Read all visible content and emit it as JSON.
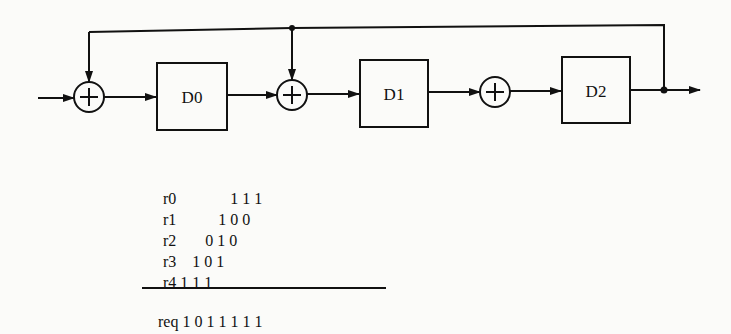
{
  "diagram": {
    "type": "lfsr-block-diagram",
    "blocks": [
      {
        "id": "D0",
        "label": "D0"
      },
      {
        "id": "D1",
        "label": "D1"
      },
      {
        "id": "D2",
        "label": "D2"
      }
    ],
    "adders": [
      {
        "id": "adder0",
        "symbol": "+"
      },
      {
        "id": "adder1",
        "symbol": "+"
      },
      {
        "id": "adder2",
        "symbol": "+"
      }
    ],
    "connections": [
      "input -> adder0",
      "adder0 -> D0",
      "D0 -> adder1",
      "adder1 -> D1",
      "D1 -> adder2",
      "adder2 -> D2",
      "D2 -> output",
      "output -> feedback -> adder0",
      "feedback -> adder1"
    ]
  },
  "table": {
    "rows": [
      {
        "label": "r0",
        "bits": "1 1 1",
        "offset": 4
      },
      {
        "label": "r1",
        "bits": "1 0 0",
        "offset": 3
      },
      {
        "label": "r2",
        "bits": "0 1 0",
        "offset": 2
      },
      {
        "label": "r3",
        "bits": "1 0 1",
        "offset": 1
      },
      {
        "label": "r4",
        "bits": "1 1 1",
        "offset": 0
      }
    ],
    "result": {
      "label": "req",
      "bits": "1 0 1 1 1 1 1"
    }
  }
}
